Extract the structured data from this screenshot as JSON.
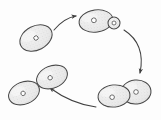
{
  "figure": {
    "background_color": "#fdfdfd",
    "outline_color": "#4a4a4a",
    "cell_fill_color": "#ededed",
    "nucleus_fill_color": "#ffffff",
    "arrow_color": "#3f3f3f",
    "stipple_color": "#9a9a9a"
  },
  "stages": [
    {
      "id": "parent-cell",
      "label": "Parent cell",
      "position": "upper-left",
      "cx": 36,
      "cy": 38,
      "rx": 17,
      "ry": 12,
      "rotation": -27,
      "nucleus": {
        "cx": 36,
        "cy": 38,
        "r": 2.2
      },
      "bud": null
    },
    {
      "id": "budding-cell",
      "label": "Cell with small bud",
      "position": "upper-right",
      "cx": 96,
      "cy": 21,
      "rx": 17,
      "ry": 11,
      "rotation": -8,
      "nucleus": {
        "cx": 94,
        "cy": 20,
        "r": 2.4
      },
      "bud": {
        "cx": 114,
        "cy": 23,
        "r": 6,
        "nucleus": {
          "cx": 114,
          "cy": 23,
          "r": 2.0
        }
      }
    },
    {
      "id": "large-bud-pair",
      "label": "Cell with large bud",
      "position": "lower-right",
      "cx": 114,
      "cy": 96,
      "rx": 16,
      "ry": 11,
      "rotation": -6,
      "nucleus": {
        "cx": 112,
        "cy": 97,
        "r": 2.3
      },
      "bud": {
        "cx": 136,
        "cy": 92,
        "r": 12,
        "nucleus": {
          "cx": 136,
          "cy": 92,
          "r": 2.3
        }
      }
    },
    {
      "id": "daughter-cell-upper",
      "label": "Separated daughter cell",
      "position": "lower-middle-left",
      "cx": 52,
      "cy": 77,
      "rx": 16,
      "ry": 11,
      "rotation": -22,
      "nucleus": {
        "cx": 50,
        "cy": 77,
        "r": 2.2
      },
      "bud": null
    },
    {
      "id": "daughter-cell-lower",
      "label": "Separated daughter cell",
      "position": "lower-left",
      "cx": 24,
      "cy": 93,
      "rx": 16,
      "ry": 11,
      "rotation": -22,
      "nucleus": {
        "cx": 23,
        "cy": 93,
        "r": 2.2
      },
      "bud": null
    }
  ],
  "arrows": [
    {
      "id": "arrow-growth",
      "label": "Parent cell to budding cell",
      "path": "M 54 30 Q 64 18 76 16",
      "head_at": [
        76,
        16
      ],
      "head_angle": -12
    },
    {
      "id": "arrow-bud-enlargement",
      "label": "Budding cell to large bud pair",
      "path": "M 124 30 Q 146 44 140 73",
      "head_at": [
        140,
        74
      ],
      "head_angle": 100
    },
    {
      "id": "arrow-separation",
      "label": "Large bud pair to separated daughter cells",
      "path": "M 96 107 Q 72 104 50 88",
      "head_at": [
        49,
        87
      ],
      "head_angle": 215
    }
  ]
}
